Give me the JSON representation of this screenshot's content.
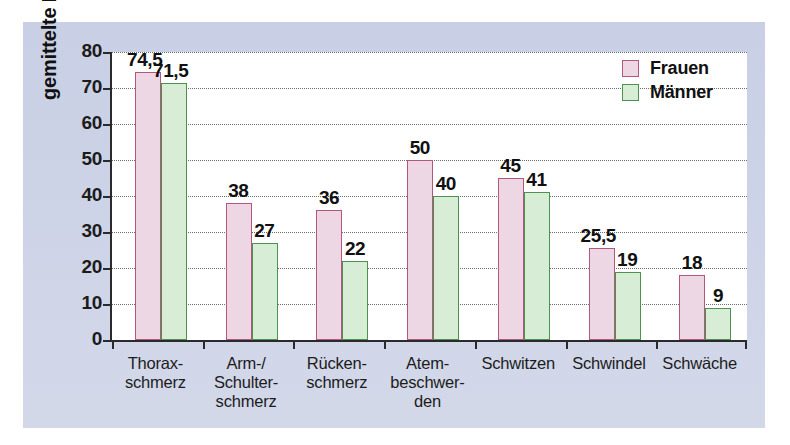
{
  "chart_data": {
    "type": "bar",
    "title": "",
    "xlabel": "",
    "ylabel": "gemittelte Häufigkeit (%)",
    "ylim": [
      0,
      80
    ],
    "yticks": [
      0,
      10,
      20,
      30,
      40,
      50,
      60,
      70,
      80
    ],
    "ytick_labels": [
      "0",
      "10",
      "20",
      "30",
      "40",
      "50",
      "60",
      "70",
      "80"
    ],
    "grid": true,
    "grid_axis": "y",
    "legend_position": "top-right",
    "categories": [
      "Thorax-\nschmerz",
      "Arm-/\nSchulter-\nschmerz",
      "Rücken-\nschmerz",
      "Atem-\nbeschwer-\nden",
      "Schwitzen",
      "Schwindel",
      "Schwäche"
    ],
    "category_lines": [
      [
        "Thorax-",
        "schmerz"
      ],
      [
        "Arm-/",
        "Schulter-",
        "schmerz"
      ],
      [
        "Rücken-",
        "schmerz"
      ],
      [
        "Atem-",
        "beschwer-",
        "den"
      ],
      [
        "Schwitzen"
      ],
      [
        "Schwindel"
      ],
      [
        "Schwäche"
      ]
    ],
    "series": [
      {
        "name": "Frauen",
        "color": "#eed7e4",
        "edge_color": "#b3577f",
        "values": [
          74.5,
          38,
          36,
          50,
          45,
          25.5,
          18
        ],
        "value_labels": [
          "74,5",
          "38",
          "36",
          "50",
          "45",
          "25,5",
          "18"
        ]
      },
      {
        "name": "Männer",
        "color": "#d8edd5",
        "edge_color": "#4c9150",
        "values": [
          71.5,
          27,
          22,
          40,
          41,
          19,
          9
        ],
        "value_labels": [
          "71,5",
          "27",
          "22",
          "40",
          "41",
          "19",
          "9"
        ]
      }
    ]
  },
  "colors": {
    "panel_background": "#ccd2e6",
    "plot_background": "#ffffff",
    "axis": "#2a2a2a",
    "grid": "#6d6d6d",
    "frauen_fill": "#eed7e4",
    "frauen_edge": "#b3577f",
    "maenner_fill": "#d8edd5",
    "maenner_edge": "#4c9150",
    "text": "#111111"
  }
}
